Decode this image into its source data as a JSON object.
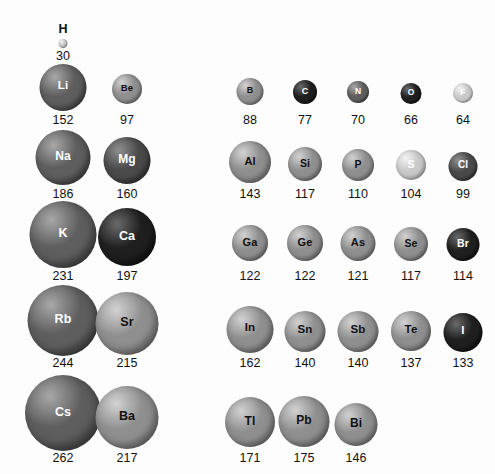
{
  "figure": {
    "title": "",
    "background_color": "#fdfdfd",
    "value_text_color": "#111111",
    "units_note": ""
  },
  "chart_data": {
    "type": "scatter",
    "title": "",
    "subtitle": "",
    "xlabel": "",
    "ylabel": "",
    "legend": [],
    "annotations": [],
    "quantity": "atomic radius",
    "unit": "pm",
    "categories": [
      "H",
      "Li",
      "Be",
      "B",
      "C",
      "N",
      "O",
      "F",
      "Na",
      "Mg",
      "Al",
      "Si",
      "P",
      "S",
      "Cl",
      "K",
      "Ca",
      "Ga",
      "Ge",
      "As",
      "Se",
      "Br",
      "Rb",
      "Sr",
      "In",
      "Sn",
      "Sb",
      "Te",
      "I",
      "Cs",
      "Ba",
      "Tl",
      "Pb",
      "Bi"
    ],
    "values": [
      30,
      152,
      97,
      88,
      77,
      70,
      66,
      64,
      186,
      160,
      143,
      117,
      110,
      104,
      99,
      231,
      197,
      122,
      122,
      121,
      117,
      114,
      244,
      215,
      162,
      140,
      140,
      137,
      133,
      262,
      217,
      171,
      175,
      146
    ],
    "rows": [
      {
        "period_label": "1",
        "left_group": [
          {
            "symbol": "H",
            "value": 30,
            "cx": 63,
            "cy": 43,
            "d": 9,
            "shade": "light",
            "label_above": true,
            "label_font": 12.5,
            "value_y": 50
          }
        ],
        "right_group": []
      },
      {
        "period_label": "2",
        "left_group": [
          {
            "symbol": "Li",
            "value": 152,
            "cx": 63,
            "cy": 87,
            "d": 47,
            "shade": "dark",
            "label_font": 11.5,
            "value_y": 114
          },
          {
            "symbol": "Be",
            "value": 97,
            "cx": 127,
            "cy": 89,
            "d": 30,
            "shade": "mid",
            "label_font": 9.5,
            "value_y": 114
          }
        ],
        "right_group": [
          {
            "symbol": "B",
            "value": 88,
            "cx": 250,
            "cy": 91,
            "d": 27,
            "shade": "mid",
            "label_font": 9,
            "value_y": 114
          },
          {
            "symbol": "C",
            "value": 77,
            "cx": 305,
            "cy": 92,
            "d": 24,
            "shade": "black",
            "label_font": 9,
            "value_y": 114
          },
          {
            "symbol": "N",
            "value": 70,
            "cx": 358,
            "cy": 92,
            "d": 22,
            "shade": "dark",
            "label_font": 8.5,
            "value_y": 114
          },
          {
            "symbol": "O",
            "value": 66,
            "cx": 411,
            "cy": 93,
            "d": 21,
            "shade": "black",
            "label_font": 8.5,
            "value_y": 114
          },
          {
            "symbol": "F",
            "value": 64,
            "cx": 463,
            "cy": 93,
            "d": 20,
            "shade": "light",
            "label_font": 8.5,
            "value_y": 114
          }
        ]
      },
      {
        "period_label": "3",
        "left_group": [
          {
            "symbol": "Na",
            "value": 186,
            "cx": 63,
            "cy": 157,
            "d": 55,
            "shade": "dark",
            "label_font": 12,
            "value_y": 188
          },
          {
            "symbol": "Mg",
            "value": 160,
            "cx": 127,
            "cy": 160,
            "d": 47,
            "shade": "darker",
            "label_font": 12,
            "value_y": 188
          }
        ],
        "right_group": [
          {
            "symbol": "Al",
            "value": 143,
            "cx": 250,
            "cy": 162,
            "d": 42,
            "shade": "mid",
            "label_font": 11,
            "value_y": 188
          },
          {
            "symbol": "Si",
            "value": 117,
            "cx": 305,
            "cy": 164,
            "d": 34,
            "shade": "mid",
            "label_font": 10.5,
            "value_y": 188
          },
          {
            "symbol": "P",
            "value": 110,
            "cx": 358,
            "cy": 165,
            "d": 32,
            "shade": "mid",
            "label_font": 10.5,
            "value_y": 188
          },
          {
            "symbol": "S",
            "value": 104,
            "cx": 411,
            "cy": 165,
            "d": 30,
            "shade": "light",
            "label_font": 10.5,
            "value_y": 188
          },
          {
            "symbol": "Cl",
            "value": 99,
            "cx": 463,
            "cy": 166,
            "d": 29,
            "shade": "darker",
            "label_font": 10,
            "value_y": 188
          }
        ]
      },
      {
        "period_label": "4",
        "left_group": [
          {
            "symbol": "K",
            "value": 231,
            "cx": 63,
            "cy": 234,
            "d": 67,
            "shade": "dark",
            "label_font": 12.5,
            "value_y": 270
          },
          {
            "symbol": "Ca",
            "value": 197,
            "cx": 127,
            "cy": 237,
            "d": 58,
            "shade": "black",
            "label_font": 12.5,
            "value_y": 270
          }
        ],
        "right_group": [
          {
            "symbol": "Ga",
            "value": 122,
            "cx": 250,
            "cy": 243,
            "d": 36,
            "shade": "mid",
            "label_font": 11,
            "value_y": 270
          },
          {
            "symbol": "Ge",
            "value": 122,
            "cx": 305,
            "cy": 243,
            "d": 36,
            "shade": "mid",
            "label_font": 11,
            "value_y": 270
          },
          {
            "symbol": "As",
            "value": 121,
            "cx": 358,
            "cy": 243,
            "d": 35,
            "shade": "mid",
            "label_font": 11,
            "value_y": 270
          },
          {
            "symbol": "Se",
            "value": 117,
            "cx": 411,
            "cy": 244,
            "d": 34,
            "shade": "mid",
            "label_font": 10.5,
            "value_y": 270
          },
          {
            "symbol": "Br",
            "value": 114,
            "cx": 463,
            "cy": 244,
            "d": 33,
            "shade": "black",
            "label_font": 10.5,
            "value_y": 270
          }
        ]
      },
      {
        "period_label": "5",
        "left_group": [
          {
            "symbol": "Rb",
            "value": 244,
            "cx": 63,
            "cy": 320,
            "d": 71,
            "shade": "dark",
            "label_font": 12.5,
            "value_y": 357
          },
          {
            "symbol": "Sr",
            "value": 215,
            "cx": 127,
            "cy": 323,
            "d": 63,
            "shade": "mid",
            "label_font": 12.5,
            "value_y": 357
          }
        ],
        "right_group": [
          {
            "symbol": "In",
            "value": 162,
            "cx": 250,
            "cy": 329,
            "d": 47,
            "shade": "mid",
            "label_font": 11.5,
            "value_y": 357
          },
          {
            "symbol": "Sn",
            "value": 140,
            "cx": 305,
            "cy": 331,
            "d": 41,
            "shade": "mid",
            "label_font": 11.5,
            "value_y": 357
          },
          {
            "symbol": "Sb",
            "value": 140,
            "cx": 358,
            "cy": 331,
            "d": 41,
            "shade": "mid",
            "label_font": 11.5,
            "value_y": 357
          },
          {
            "symbol": "Te",
            "value": 137,
            "cx": 411,
            "cy": 331,
            "d": 40,
            "shade": "mid",
            "label_font": 11.5,
            "value_y": 357
          },
          {
            "symbol": "I",
            "value": 133,
            "cx": 463,
            "cy": 332,
            "d": 39,
            "shade": "black",
            "label_font": 11.5,
            "value_y": 357
          }
        ]
      },
      {
        "period_label": "6",
        "left_group": [
          {
            "symbol": "Cs",
            "value": 262,
            "cx": 63,
            "cy": 413,
            "d": 76,
            "shade": "dark",
            "label_font": 12.5,
            "value_y": 452
          },
          {
            "symbol": "Ba",
            "value": 217,
            "cx": 127,
            "cy": 417,
            "d": 63,
            "shade": "mid",
            "label_font": 12.5,
            "value_y": 452
          },
          {
            "symbol": "Tl",
            "value": 171,
            "cx": 250,
            "cy": 422,
            "d": 50,
            "shade": "mid",
            "label_font": 12,
            "value_y": 452
          },
          {
            "symbol": "Pb",
            "value": 175,
            "cx": 304,
            "cy": 421,
            "d": 51,
            "shade": "mid",
            "label_font": 12,
            "value_y": 452
          },
          {
            "symbol": "Bi",
            "value": 146,
            "cx": 356,
            "cy": 424,
            "d": 43,
            "shade": "mid",
            "label_font": 12,
            "value_y": 452
          }
        ],
        "right_group": []
      }
    ]
  }
}
